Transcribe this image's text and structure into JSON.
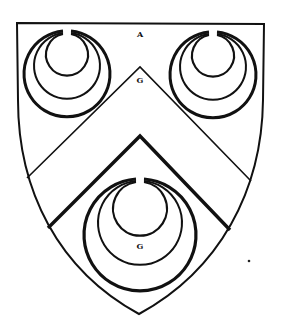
{
  "figure": {
    "background_color": "#ffffff",
    "ink_color": "#111111"
  },
  "shield": {
    "top_left": [
      17,
      23
    ],
    "top_right": [
      264,
      24
    ],
    "bottom_point": [
      139,
      314
    ]
  },
  "chevron": {
    "upper_peak": [
      140,
      67
    ],
    "upper_left_end": [
      27,
      178
    ],
    "upper_right_end": [
      251,
      181
    ],
    "lower_peak": [
      140,
      136
    ],
    "lower_left_end": [
      48,
      228
    ],
    "lower_right_end": [
      230,
      230
    ]
  },
  "crescents": [
    {
      "name": "crescent-dexter-chief",
      "cx": 67,
      "outer_r": 43,
      "mid_r": 33,
      "inner_r": 21,
      "top": 31
    },
    {
      "name": "crescent-sinister-chief",
      "cx": 213,
      "outer_r": 43,
      "mid_r": 33,
      "inner_r": 21,
      "top": 32
    },
    {
      "name": "crescent-base",
      "cx": 140,
      "outer_r": 56,
      "mid_r": 42,
      "inner_r": 27,
      "top": 179
    }
  ],
  "labels": {
    "field": "A",
    "chevron": "G",
    "base_crescent": "G"
  },
  "label_positions": {
    "field": [
      140,
      34
    ],
    "chevron": [
      140,
      80
    ],
    "base_crescent": [
      140,
      246
    ]
  },
  "stray_mark": [
    249,
    261
  ]
}
